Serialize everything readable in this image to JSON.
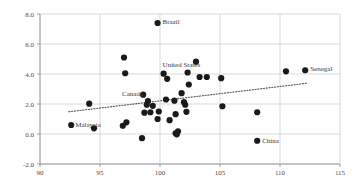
{
  "chart_data": {
    "type": "scatter",
    "title": "",
    "xlabel": "",
    "ylabel": "",
    "xlim": [
      90,
      115
    ],
    "ylim": [
      -2.0,
      8.0
    ],
    "xticks": [
      90,
      95,
      100,
      105,
      110,
      115
    ],
    "xtick_labels": [
      "90",
      "95",
      "100",
      "105",
      "110",
      "115"
    ],
    "yticks": [
      -2.0,
      0.0,
      2.0,
      4.0,
      6.0,
      8.0
    ],
    "ytick_labels": [
      "-2.0",
      "0.0",
      "2.0",
      "4.0",
      "6.0",
      "8.0"
    ],
    "grid": true,
    "grid_color": "#c8c8c8",
    "legend": "none",
    "marker_color": "#1a1a1a",
    "marker_size": 3.1,
    "trendline": {
      "style": "dotted",
      "color": "#555555",
      "x_start": 92.4,
      "y_start": 1.48,
      "x_end": 112.2,
      "y_end": 3.38
    },
    "points": [
      {
        "x": 92.6,
        "y": 0.6,
        "label": "Malaysia",
        "label_dx": 4,
        "label_dy": 2
      },
      {
        "x": 94.1,
        "y": 2.02,
        "label": ""
      },
      {
        "x": 94.5,
        "y": 0.38,
        "label": ""
      },
      {
        "x": 96.9,
        "y": 0.55,
        "label": ""
      },
      {
        "x": 97.0,
        "y": 5.1,
        "label": ""
      },
      {
        "x": 97.1,
        "y": 4.05,
        "label": ""
      },
      {
        "x": 97.2,
        "y": 0.78,
        "label": ""
      },
      {
        "x": 98.5,
        "y": -0.28,
        "label": ""
      },
      {
        "x": 98.6,
        "y": 2.62,
        "label": ""
      },
      {
        "x": 98.7,
        "y": 1.42,
        "label": ""
      },
      {
        "x": 98.9,
        "y": 1.95,
        "label": ""
      },
      {
        "x": 99.0,
        "y": 2.2,
        "label": "Canada",
        "label_dx": -26,
        "label_dy": -5
      },
      {
        "x": 99.2,
        "y": 1.45,
        "label": ""
      },
      {
        "x": 99.4,
        "y": 1.88,
        "label": ""
      },
      {
        "x": 99.8,
        "y": 7.4,
        "label": "Brazil",
        "label_dx": 5,
        "label_dy": 1
      },
      {
        "x": 99.8,
        "y": 1.0,
        "label": ""
      },
      {
        "x": 99.9,
        "y": 1.5,
        "label": ""
      },
      {
        "x": 100.3,
        "y": 4.02,
        "label": ""
      },
      {
        "x": 100.5,
        "y": 2.3,
        "label": ""
      },
      {
        "x": 100.6,
        "y": 3.68,
        "label": ""
      },
      {
        "x": 100.8,
        "y": 0.92,
        "label": ""
      },
      {
        "x": 101.2,
        "y": 2.22,
        "label": ""
      },
      {
        "x": 101.3,
        "y": 1.32,
        "label": ""
      },
      {
        "x": 101.3,
        "y": 0.05,
        "label": ""
      },
      {
        "x": 101.4,
        "y": -0.02,
        "label": ""
      },
      {
        "x": 101.5,
        "y": 0.18,
        "label": ""
      },
      {
        "x": 101.8,
        "y": 2.72,
        "label": ""
      },
      {
        "x": 102.0,
        "y": 2.12,
        "label": ""
      },
      {
        "x": 102.1,
        "y": 1.95,
        "label": ""
      },
      {
        "x": 102.2,
        "y": 1.48,
        "label": ""
      },
      {
        "x": 102.3,
        "y": 4.1,
        "label": "United States",
        "label_dx": -25,
        "label_dy": -6
      },
      {
        "x": 102.4,
        "y": 3.3,
        "label": ""
      },
      {
        "x": 103.0,
        "y": 4.82,
        "label": ""
      },
      {
        "x": 103.3,
        "y": 3.8,
        "label": ""
      },
      {
        "x": 103.9,
        "y": 3.8,
        "label": ""
      },
      {
        "x": 105.1,
        "y": 3.72,
        "label": ""
      },
      {
        "x": 105.2,
        "y": 1.85,
        "label": ""
      },
      {
        "x": 108.1,
        "y": 1.45,
        "label": ""
      },
      {
        "x": 108.1,
        "y": -0.45,
        "label": "China",
        "label_dx": 5,
        "label_dy": 2
      },
      {
        "x": 110.5,
        "y": 4.18,
        "label": ""
      },
      {
        "x": 112.1,
        "y": 4.25,
        "label": "Senegal",
        "label_dx": 5,
        "label_dy": 1
      }
    ]
  }
}
